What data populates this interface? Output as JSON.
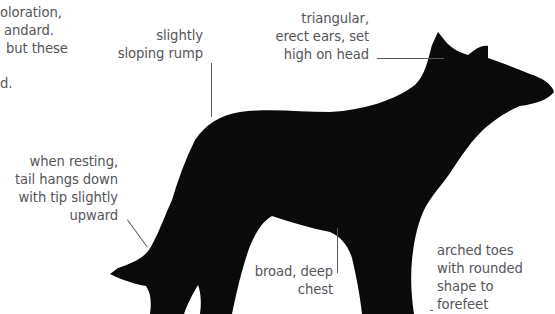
{
  "intro_text_fragment": {
    "lines": [
      "oloration,",
      "andard.",
      "but these",
      "",
      "d."
    ]
  },
  "annotations": {
    "rump": {
      "lines": [
        "slightly",
        "sloping rump"
      ]
    },
    "ears": {
      "lines": [
        "triangular,",
        "erect ears, set",
        "high on head"
      ]
    },
    "tail": {
      "lines": [
        "when resting,",
        "tail hangs down",
        "with tip slightly",
        "upward"
      ]
    },
    "chest": {
      "lines": [
        "broad, deep",
        "chest"
      ]
    },
    "toes": {
      "lines": [
        "arched toes",
        "with rounded",
        "shape to",
        "forefeet"
      ]
    }
  },
  "image": {
    "subject": "black dog standing in profile, facing right",
    "colors": {
      "dog": "#0a0a0a",
      "text": "#55555a",
      "leader_line": "#5a5a5a",
      "background": "#ffffff"
    }
  }
}
